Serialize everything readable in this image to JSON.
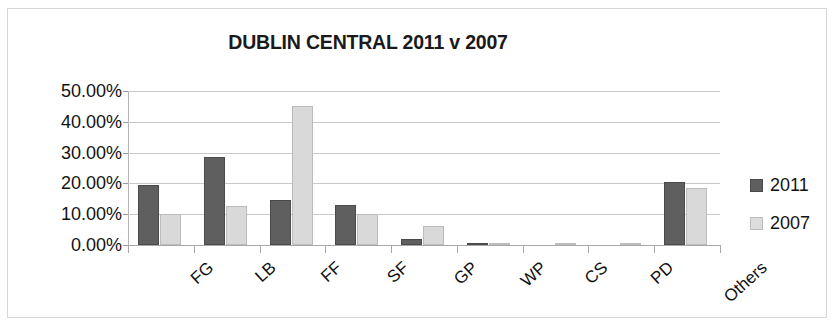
{
  "chart_data": {
    "type": "bar",
    "title": "DUBLIN CENTRAL 2011 v 2007",
    "xlabel": "",
    "ylabel": "",
    "ylim": [
      0,
      50
    ],
    "ytick_labels": [
      "50.00%",
      "40.00%",
      "30.00%",
      "20.00%",
      "10.00%",
      "0.00%"
    ],
    "ytick_values": [
      50,
      40,
      30,
      20,
      10,
      0
    ],
    "grid": true,
    "legend_position": "right",
    "categories": [
      "FG",
      "LB",
      "FF",
      "SF",
      "GP",
      "WP",
      "CS",
      "PD",
      "Others"
    ],
    "series": [
      {
        "name": "2011",
        "color": "#5f5f5f",
        "values": [
          19.5,
          28.5,
          14.5,
          13.0,
          1.8,
          0.6,
          0.0,
          0.0,
          20.6
        ]
      },
      {
        "name": "2007",
        "color": "#d9d9d9",
        "values": [
          10.0,
          12.7,
          45.0,
          10.0,
          6.2,
          0.8,
          0.8,
          0.8,
          18.4
        ]
      }
    ]
  },
  "legend": {
    "items": [
      {
        "label": "2011"
      },
      {
        "label": "2007"
      }
    ]
  }
}
